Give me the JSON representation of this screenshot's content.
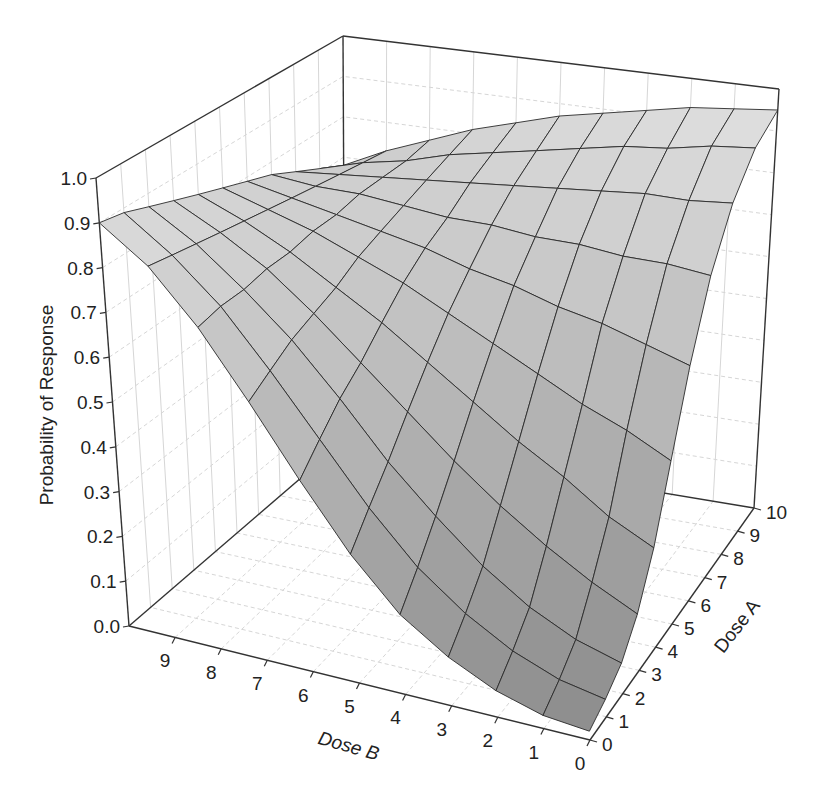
{
  "chart_data": {
    "type": "surface3d",
    "title": "",
    "zlabel": "Probability of Response",
    "xlabel": "Dose B",
    "ylabel": "Dose A",
    "zlim": [
      0.0,
      1.0
    ],
    "xlim": [
      0,
      10
    ],
    "ylim": [
      0,
      10
    ],
    "z_ticks": [
      "0.0",
      "0.1",
      "0.2",
      "0.3",
      "0.4",
      "0.5",
      "0.6",
      "0.7",
      "0.8",
      "0.9",
      "1.0"
    ],
    "dose_b_ticks": [
      "0",
      "1",
      "2",
      "3",
      "4",
      "5",
      "6",
      "7",
      "8",
      "9"
    ],
    "dose_a_ticks": [
      "0",
      "1",
      "2",
      "3",
      "4",
      "5",
      "6",
      "7",
      "8",
      "9",
      "10"
    ],
    "grid": true,
    "legend": "none",
    "dose_a_values": [
      0,
      1,
      2,
      3,
      4,
      5,
      6,
      7,
      8,
      9,
      10
    ],
    "dose_b_values": [
      0,
      1,
      2,
      3,
      4,
      5,
      6,
      7,
      8,
      9,
      10
    ],
    "z_grid_rows_by_dose_a": [
      [
        0.02,
        0.03,
        0.06,
        0.11,
        0.18,
        0.29,
        0.43,
        0.58,
        0.72,
        0.83,
        0.9
      ],
      [
        0.04,
        0.06,
        0.1,
        0.16,
        0.24,
        0.35,
        0.48,
        0.61,
        0.73,
        0.82,
        0.89
      ],
      [
        0.07,
        0.1,
        0.15,
        0.22,
        0.31,
        0.41,
        0.53,
        0.64,
        0.73,
        0.81,
        0.87
      ],
      [
        0.13,
        0.18,
        0.24,
        0.31,
        0.39,
        0.48,
        0.57,
        0.66,
        0.74,
        0.8,
        0.85
      ],
      [
        0.23,
        0.28,
        0.35,
        0.41,
        0.48,
        0.55,
        0.62,
        0.68,
        0.74,
        0.79,
        0.83
      ],
      [
        0.38,
        0.43,
        0.47,
        0.52,
        0.57,
        0.62,
        0.67,
        0.71,
        0.75,
        0.78,
        0.81
      ],
      [
        0.55,
        0.58,
        0.61,
        0.63,
        0.66,
        0.68,
        0.71,
        0.73,
        0.75,
        0.77,
        0.79
      ],
      [
        0.71,
        0.72,
        0.72,
        0.73,
        0.73,
        0.74,
        0.74,
        0.75,
        0.76,
        0.76,
        0.77
      ],
      [
        0.83,
        0.82,
        0.82,
        0.81,
        0.8,
        0.79,
        0.78,
        0.77,
        0.76,
        0.75,
        0.74
      ],
      [
        0.91,
        0.9,
        0.88,
        0.87,
        0.85,
        0.83,
        0.81,
        0.79,
        0.76,
        0.74,
        0.71
      ],
      [
        0.95,
        0.94,
        0.93,
        0.91,
        0.89,
        0.87,
        0.84,
        0.81,
        0.77,
        0.73,
        0.68
      ]
    ],
    "colors": {
      "surface_high": "#e4e4e4",
      "surface_low": "#8c8c8c",
      "mesh": "#2a2a2a",
      "axis": "#333333",
      "gridline": "#d6d6d6"
    }
  }
}
